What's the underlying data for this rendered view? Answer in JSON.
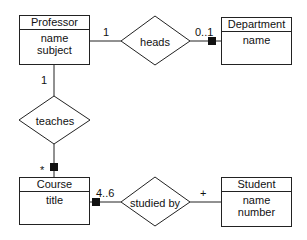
{
  "diagram": {
    "type": "entity-relationship",
    "entities": [
      {
        "id": "professor",
        "name": "Professor",
        "attributes": [
          "name",
          "subject"
        ]
      },
      {
        "id": "department",
        "name": "Department",
        "attributes": [
          "name"
        ]
      },
      {
        "id": "course",
        "name": "Course",
        "attributes": [
          "title"
        ]
      },
      {
        "id": "student",
        "name": "Student",
        "attributes": [
          "name",
          "number"
        ]
      }
    ],
    "relationships": [
      {
        "id": "heads",
        "name": "heads",
        "from": "professor",
        "to": "department",
        "from_multiplicity": "1",
        "to_multiplicity": "0..1"
      },
      {
        "id": "teaches",
        "name": "teaches",
        "from": "professor",
        "to": "course",
        "from_multiplicity": "1",
        "to_multiplicity": "*"
      },
      {
        "id": "studied_by",
        "name": "studied by",
        "from": "course",
        "to": "student",
        "from_multiplicity": "4..6",
        "to_multiplicity": "+"
      }
    ]
  },
  "colors": {
    "line": "#222222",
    "fill": "#ffffff",
    "marker": "#111111"
  }
}
